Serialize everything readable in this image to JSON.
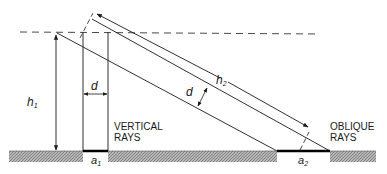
{
  "diagram": {
    "labels": {
      "h1": "h",
      "h1_sub": "1",
      "h2": "h",
      "h2_sub": "2",
      "d_vertical": "d",
      "d_oblique": "d",
      "a1": "a",
      "a1_sub": "1",
      "a2": "a",
      "a2_sub": "2",
      "vertical_rays_line1": "VERTICAL",
      "vertical_rays_line2": "RAYS",
      "oblique_rays_line1": "OBLIQUE",
      "oblique_rays_line2": "RAYS"
    },
    "colors": {
      "line": "#1a1a1a",
      "ground": "#9a9a9a",
      "background": "#ffffff"
    }
  }
}
